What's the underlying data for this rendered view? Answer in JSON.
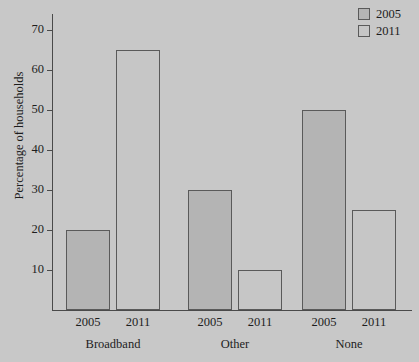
{
  "chart_data": {
    "type": "bar",
    "title": "",
    "subtitle": "",
    "xlabel": "",
    "ylabel": "Percentage of households",
    "categories": [
      "Broadband",
      "Other",
      "None"
    ],
    "series": [
      {
        "name": "2005",
        "values": [
          20,
          30,
          50
        ],
        "color": "#b4b4b4"
      },
      {
        "name": "2011",
        "values": [
          65,
          10,
          25
        ],
        "color": "#c6c6c6"
      }
    ],
    "ylim": [
      0,
      74
    ],
    "yticks": [
      10,
      20,
      30,
      40,
      50,
      60,
      70
    ],
    "ytick_labels": [
      "10",
      "20",
      "30",
      "40",
      "50",
      "60",
      "70"
    ],
    "grid": false,
    "legend_position": "top-right",
    "legend_entries": [
      "2005",
      "2011"
    ],
    "bar_sublabels": [
      "2005",
      "2011",
      "2005",
      "2011",
      "2005",
      "2011"
    ],
    "background_color": "#c8c8c8",
    "axis_color": "#4a4a4a",
    "bar_border_color": "#5a5a5a"
  },
  "axis": {
    "y_title": "Percentage of households"
  },
  "legend": {
    "items": [
      {
        "label": "2005"
      },
      {
        "label": "2011"
      }
    ]
  },
  "groups": [
    {
      "label": "Broadband",
      "bars": [
        {
          "series": "2005",
          "value": 20,
          "sublabel": "2005"
        },
        {
          "series": "2011",
          "value": 65,
          "sublabel": "2011"
        }
      ]
    },
    {
      "label": "Other",
      "bars": [
        {
          "series": "2005",
          "value": 30,
          "sublabel": "2005"
        },
        {
          "series": "2011",
          "value": 10,
          "sublabel": "2011"
        }
      ]
    },
    {
      "label": "None",
      "bars": [
        {
          "series": "2005",
          "value": 50,
          "sublabel": "2005"
        },
        {
          "series": "2011",
          "value": 25,
          "sublabel": "2011"
        }
      ]
    }
  ],
  "yticks": [
    {
      "label": "70",
      "value": 70
    },
    {
      "label": "60",
      "value": 60
    },
    {
      "label": "50",
      "value": 50
    },
    {
      "label": "40",
      "value": 40
    },
    {
      "label": "30",
      "value": 30
    },
    {
      "label": "20",
      "value": 20
    },
    {
      "label": "10",
      "value": 10
    }
  ]
}
